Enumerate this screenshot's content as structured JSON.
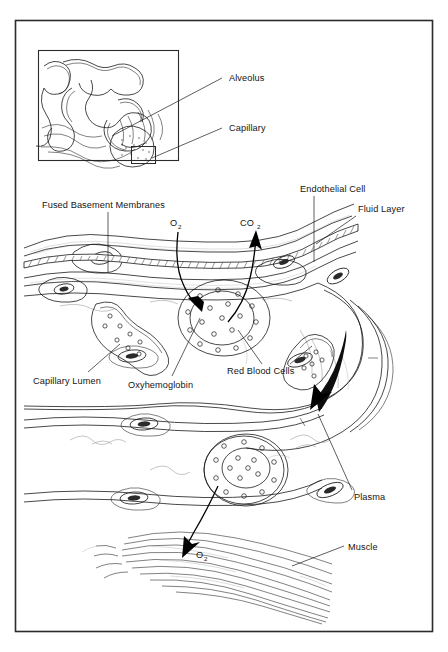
{
  "figure": {
    "background_color": "#ffffff",
    "ink_color": "#1a1a1a",
    "frame_color": "#2b2b2b"
  },
  "inset": {
    "name": "alveolus-capillary-overview",
    "labels": [
      {
        "id": "alveolus",
        "text": "Alveolus"
      },
      {
        "id": "capillary",
        "text": "Capillary"
      }
    ]
  },
  "main": {
    "labels": [
      {
        "id": "fused-basement-membranes",
        "text": "Fused Basement Membranes"
      },
      {
        "id": "endothelial-cell",
        "text": "Endothelial Cell"
      },
      {
        "id": "fluid-layer",
        "text": "Fluid Layer"
      },
      {
        "id": "capillary-lumen",
        "text": "Capillary Lumen"
      },
      {
        "id": "oxyhemoglobin",
        "text": "Oxyhemoglobin"
      },
      {
        "id": "red-blood-cells",
        "text": "Red Blood Cells"
      },
      {
        "id": "plasma",
        "text": "Plasma"
      },
      {
        "id": "muscle",
        "text": "Muscle"
      }
    ],
    "gas_labels": [
      {
        "id": "oxygen-in",
        "base": "O",
        "sub": "2"
      },
      {
        "id": "carbon-dioxide-out",
        "base": "CO",
        "sub": "2"
      },
      {
        "id": "oxygen-to-muscle",
        "base": "O",
        "sub": "2"
      }
    ]
  }
}
